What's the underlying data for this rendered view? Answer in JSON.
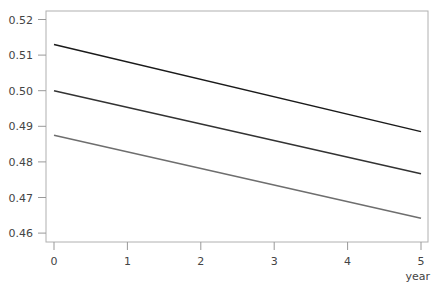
{
  "chart_data": {
    "type": "line",
    "title": "",
    "xlabel": "year",
    "ylabel": "",
    "x": [
      0,
      5
    ],
    "xticks": [
      "0",
      "1",
      "2",
      "3",
      "4",
      "5"
    ],
    "yticks": [
      "0.52",
      "0.51",
      "0.50",
      "0.49",
      "0.48",
      "0.47",
      "0.46"
    ],
    "xlim": [
      0,
      5
    ],
    "ylim": [
      0.4575,
      0.5225
    ],
    "grid": false,
    "legend": null,
    "series": [
      {
        "name": "upper",
        "color": "#1a1a1a",
        "values": [
          0.513,
          0.4885
        ]
      },
      {
        "name": "middle",
        "color": "#333333",
        "values": [
          0.5,
          0.4767
        ]
      },
      {
        "name": "lower",
        "color": "#6e6e6e",
        "values": [
          0.4875,
          0.4642
        ]
      }
    ]
  }
}
